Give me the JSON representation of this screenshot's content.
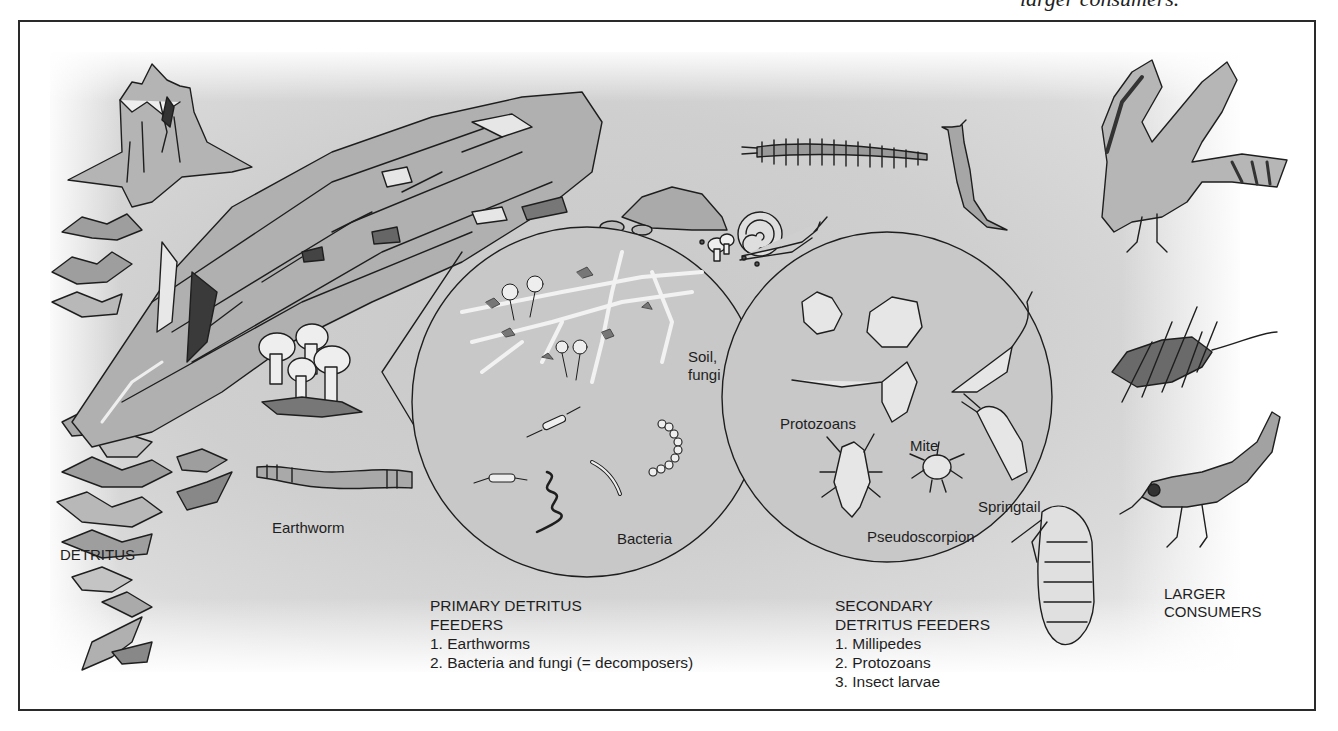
{
  "caption_fragment": "larger consumers.",
  "labels": {
    "detritus": "DETRITUS",
    "earthworm": "Earthworm",
    "soil_fungi_line1": "Soil,",
    "soil_fungi_line2": "fungi",
    "bacteria": "Bacteria",
    "protozoans": "Protozoans",
    "mite": "Mite",
    "springtail": "Springtail",
    "pseudoscorpion": "Pseudoscorpion",
    "larger_consumers_line1": "LARGER",
    "larger_consumers_line2": "CONSUMERS"
  },
  "primary": {
    "title_line1": "PRIMARY DETRITUS",
    "title_line2": "FEEDERS",
    "items": [
      "1. Earthworms",
      "2. Bacteria and fungi (= decomposers)"
    ]
  },
  "secondary": {
    "title_line1": "SECONDARY",
    "title_line2": "DETRITUS FEEDERS",
    "items": [
      "1. Millipedes",
      "2. Protozoans",
      "3. Insect larvae"
    ]
  },
  "illustrations": [
    "tree-stump",
    "rotting-log",
    "mushrooms",
    "leaf-litter",
    "earthworm",
    "millipede",
    "slug",
    "snail",
    "rock",
    "soil-fungi-circle",
    "protozoa-circle",
    "insect-larva",
    "hawk",
    "rat",
    "bird"
  ],
  "colors": {
    "ink": "#1e1e1e",
    "panel": "#cdcdcd",
    "light_fill": "#e6e6e6",
    "mid_fill": "#a9a9a9",
    "dark_fill": "#555555"
  }
}
